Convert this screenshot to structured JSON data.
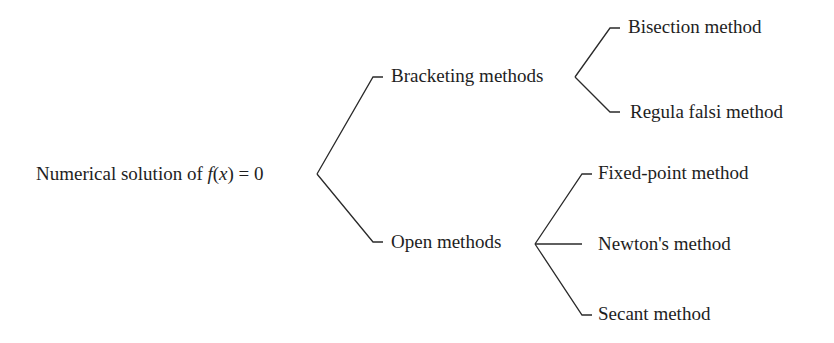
{
  "diagram": {
    "type": "tree",
    "root": {
      "label_prefix": "Numerical solution of ",
      "label_math_f": "f",
      "label_math_open": "(",
      "label_math_x": "x",
      "label_math_close": ") = 0"
    },
    "branches": [
      {
        "label": "Bracketing methods",
        "children": [
          {
            "label": "Bisection method"
          },
          {
            "label": "Regula falsi method"
          }
        ]
      },
      {
        "label": "Open methods",
        "children": [
          {
            "label": "Fixed-point method"
          },
          {
            "label": "Newton's method"
          },
          {
            "label": "Secant method"
          }
        ]
      }
    ],
    "line_color": "#2a2a2a",
    "text_color": "#1e1e1e"
  }
}
